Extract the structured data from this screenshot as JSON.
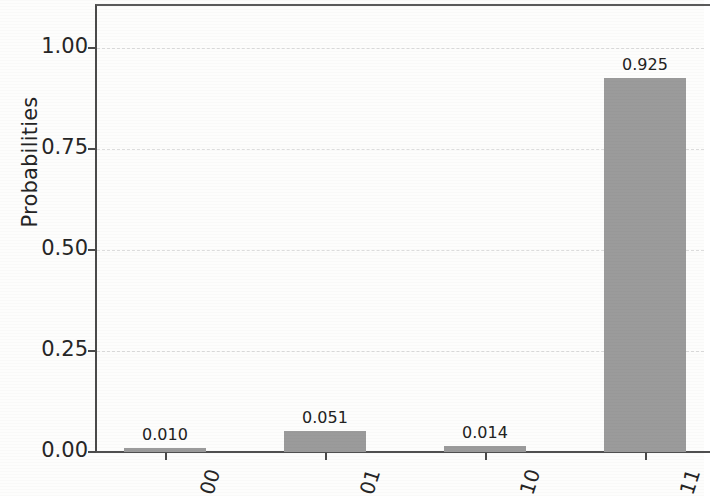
{
  "chart_data": {
    "type": "bar",
    "title": "",
    "xlabel": "",
    "ylabel": "Probabilities",
    "categories": [
      "00",
      "01",
      "10",
      "11"
    ],
    "values": [
      0.01,
      0.051,
      0.014,
      0.925
    ],
    "value_labels": [
      "0.010",
      "0.051",
      "0.014",
      "0.925"
    ],
    "ylim": [
      0.0,
      1.12
    ],
    "yticks": [
      0.0,
      0.25,
      0.5,
      0.75,
      1.0
    ],
    "ytick_labels": [
      "0.00",
      "0.25",
      "0.50",
      "0.75",
      "1.00"
    ],
    "grid": true,
    "grid_axis": "y",
    "legend": null,
    "bar_color": "#9b9b9b",
    "xtick_rotation": -72
  },
  "axes": {
    "ylabel": "Probabilities"
  }
}
